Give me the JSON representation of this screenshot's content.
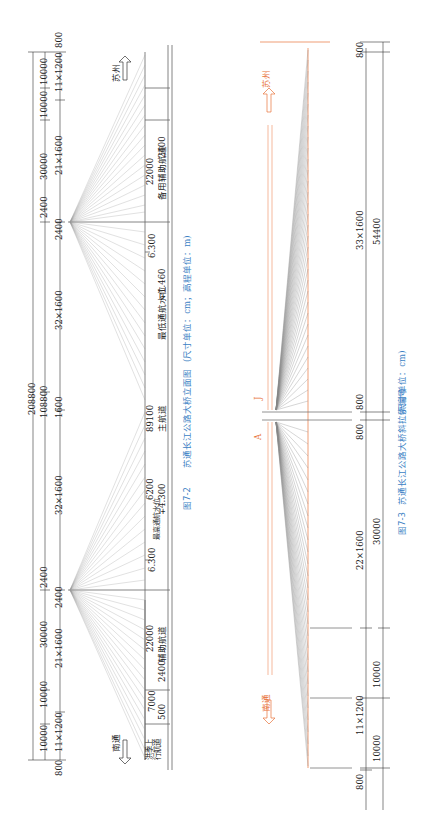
{
  "figure_7_2": {
    "caption_number": "图7-2",
    "caption_title": "苏通长江公路大桥立面图",
    "caption_units": "(尺寸单位：cm；高程单位：m)",
    "direction_top": "苏州",
    "direction_bottom": "南通",
    "dimensions": {
      "total": "208800",
      "main_span": "108800",
      "top_800": "800",
      "top_11x1200": "11×1200",
      "top_10000_a": "10000",
      "top_10000_b": "10000",
      "top_30000": "30000",
      "top_21x1600": "21×1600",
      "tower_top_2400_a": "2400",
      "tower_top_2400_b": "2400",
      "mid_32x1600_a": "32×1600",
      "mid_1600": "1600",
      "mid_32x1600_b": "32×1600",
      "tower_bot_2400_a": "2400",
      "tower_bot_2400_b": "2400",
      "bot_21x1600": "21×1600",
      "bot_30000": "30000",
      "bot_10000_a": "10000",
      "bot_10000_b": "10000",
      "bot_11x1200": "11×1200",
      "bot_800": "800"
    },
    "channels": {
      "backup_aux": "备用辅助航道",
      "backup_aux_width": "22000",
      "backup_aux_offset": "2400",
      "elev_top": "6.300",
      "lowest_water": "最低通航水位",
      "lowest_water_value": "∓1.460",
      "main_width": "89100",
      "main_label": "主航道",
      "main_offset": "6200",
      "highest_water": "最高通航水位",
      "highest_water_value": "∓4.300",
      "elev_bottom": "6.300",
      "aux": "辅助航道",
      "aux_width": "22000",
      "aux_offset": "2400",
      "flood_width": "7000",
      "flood_offset": "500",
      "flood_label": "洪季上行航道"
    }
  },
  "figure_7_3": {
    "caption_number": "图7-3",
    "caption_title": "苏通长江公路大桥斜拉索编号",
    "caption_units": "(尺寸单位：cm)",
    "direction_top": "苏州",
    "direction_bottom": "南通",
    "section_mark_a": "A",
    "section_mark_b": "J",
    "cable_numbers_top": [
      "34",
      "33",
      "32",
      "31",
      "30",
      "29",
      "28",
      "27",
      "26",
      "25",
      "24",
      "23",
      "22",
      "21",
      "20",
      "19",
      "18",
      "17",
      "16",
      "15",
      "14",
      "13",
      "12",
      "11",
      "10",
      "9",
      "8",
      "7",
      "6",
      "5",
      "4",
      "3",
      "2",
      "1"
    ],
    "cable_numbers_bottom": [
      "1",
      "2",
      "3",
      "4",
      "5",
      "6",
      "7",
      "8",
      "9",
      "10",
      "11",
      "12",
      "13",
      "14",
      "15",
      "16",
      "17",
      "18",
      "19",
      "20",
      "21",
      "22",
      "23",
      "24",
      "25",
      "26",
      "27",
      "28",
      "29",
      "30",
      "31",
      "32",
      "33",
      "34"
    ],
    "dimensions": {
      "top_800": "800",
      "top_33x1600": "33×1600",
      "top_54400": "54400",
      "center_800_a": "800",
      "center_800_b": "800",
      "bot_22x1600": "22×1600",
      "bot_30000": "30000",
      "bot_10000_a": "10000",
      "bot_11x1200": "11×1200",
      "bot_10000_b": "10000",
      "bot_800": "800"
    }
  },
  "colors": {
    "drawing_line": "#555555",
    "caption_blue": "#3b7fc4",
    "cable_orange": "#e8733a"
  }
}
